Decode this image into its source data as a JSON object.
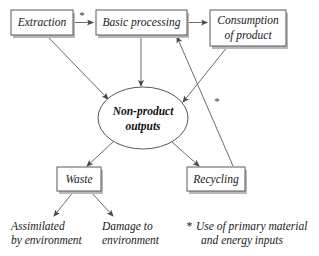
{
  "diagram": {
    "background_color": "#ffffff",
    "line_color": "#6b6b6b",
    "box_stroke_color": "#585858",
    "shadow_color": "#b8b8b8",
    "nodes": {
      "extraction": {
        "label": "Extraction"
      },
      "basic_processing": {
        "label": "Basic processing"
      },
      "consumption": {
        "label_line1": "Consumption",
        "label_line2": "of product"
      },
      "non_product_outputs": {
        "label_line1": "Non-product",
        "label_line2": "outputs"
      },
      "waste": {
        "label": "Waste"
      },
      "recycling": {
        "label": "Recycling"
      },
      "assimilated": {
        "label_line1": "Assimilated",
        "label_line2": "by environment"
      },
      "damage": {
        "label_line1": "Damage to",
        "label_line2": "environment"
      }
    },
    "marks": {
      "star_top": "*",
      "star_right": "*"
    },
    "legend": {
      "marker": "*",
      "line1": "Use of primary material",
      "line2": "and energy inputs"
    }
  }
}
